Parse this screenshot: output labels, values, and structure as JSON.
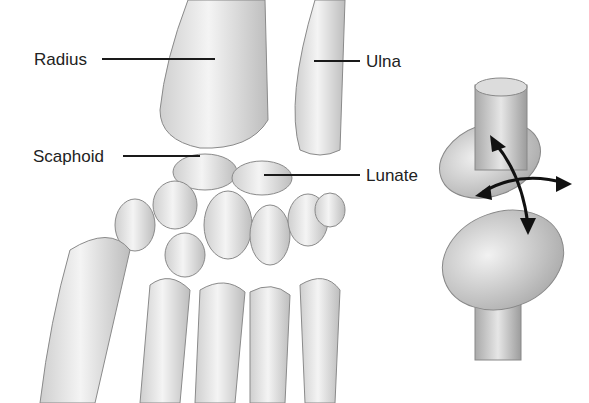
{
  "diagram": {
    "labels": [
      {
        "id": "radius",
        "text": "Radius"
      },
      {
        "id": "ulna",
        "text": "Ulna"
      },
      {
        "id": "scaphoid",
        "text": "Scaphoid"
      },
      {
        "id": "lunate",
        "text": "Lunate"
      }
    ],
    "model": {
      "type": "condyloid-joint-model",
      "arrows": [
        "flexion-extension",
        "abduction-adduction"
      ]
    },
    "colors": {
      "bone_fill": "#e9e9e9",
      "bone_stroke": "#8a8a8a",
      "leader_line": "#1a1a1a",
      "text": "#222222",
      "arrow": "#111111"
    }
  }
}
